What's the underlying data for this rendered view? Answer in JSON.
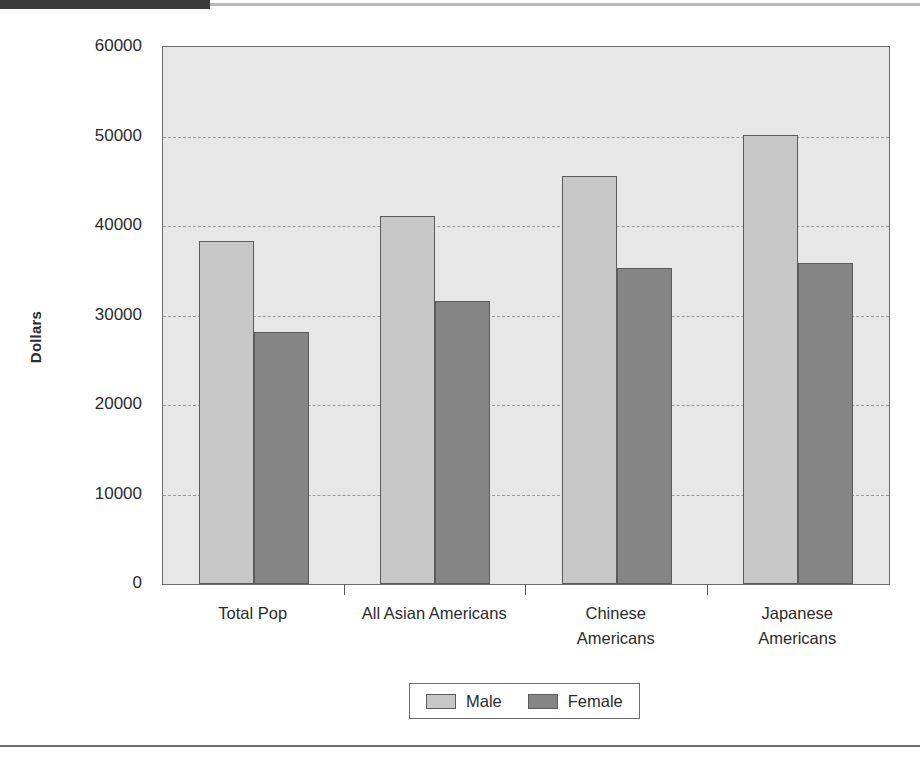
{
  "figure": {
    "y_axis_title": "Dollars"
  },
  "chart_data": {
    "type": "bar",
    "title": "",
    "xlabel": "",
    "ylabel": "Dollars",
    "ylim": [
      0,
      60000
    ],
    "ytick_labels": [
      "60000",
      "50000",
      "40000",
      "30000",
      "20000",
      "10000",
      "0"
    ],
    "yticks": [
      60000,
      50000,
      40000,
      30000,
      20000,
      10000,
      0
    ],
    "grid": true,
    "legend_position": "bottom-center",
    "categories": [
      "Total Pop",
      "All Asian Americans",
      "Chinese Americans",
      "Japanese Americans"
    ],
    "category_lines": [
      [
        "Total Pop"
      ],
      [
        "All Asian Americans"
      ],
      [
        "Chinese",
        "Americans"
      ],
      [
        "Japanese",
        "Americans"
      ]
    ],
    "series": [
      {
        "name": "Male",
        "color": "#c7c7c7",
        "values": [
          38300,
          41100,
          45600,
          50200
        ]
      },
      {
        "name": "Female",
        "color": "#858585",
        "values": [
          28200,
          31600,
          35300,
          35900
        ]
      }
    ]
  },
  "legend": {
    "entries": [
      {
        "label": "Male",
        "color": "#c7c7c7"
      },
      {
        "label": "Female",
        "color": "#858585"
      }
    ]
  }
}
